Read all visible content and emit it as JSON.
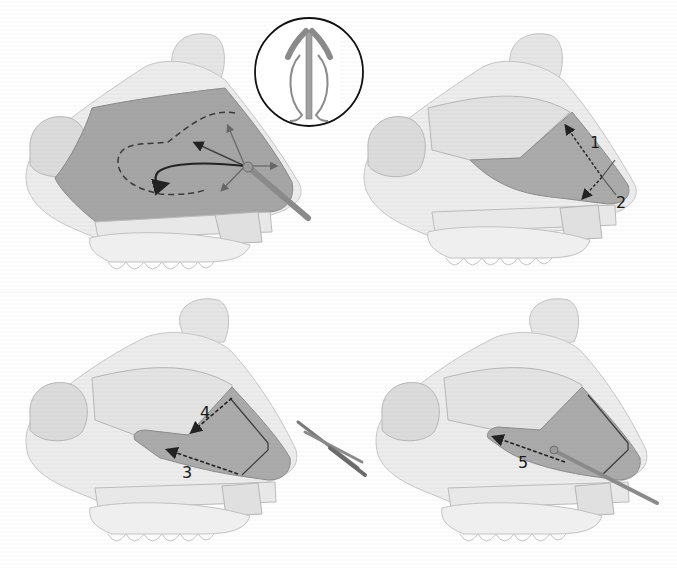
{
  "figure": {
    "panels": [
      {
        "id": "top-left",
        "content": "Septum with elevator instrument and directional arrows showing mucoperichondrial flap elevation; dashed outline",
        "inset": "Nasal speculum in circle"
      },
      {
        "id": "top-right",
        "content": "Exposed cartilage with dimension arrows",
        "labels": [
          "1",
          "2"
        ]
      },
      {
        "id": "bottom-left",
        "content": "Cartilage incisions with dashed arrows; scissors at right",
        "labels": [
          "4",
          "3"
        ]
      },
      {
        "id": "bottom-right",
        "content": "Elevator inserted along dashed arrow",
        "labels": [
          "5"
        ]
      }
    ]
  },
  "labels": {
    "one": "1",
    "two": "2",
    "three": "3",
    "four": "4",
    "five": "5"
  },
  "colors": {
    "bone": "#ebebeb",
    "bone_outline": "#bdbdbd",
    "septum_dark": "#9e9e9e",
    "cartilage_mid": "#b4b4b4",
    "lines": "#222222"
  }
}
